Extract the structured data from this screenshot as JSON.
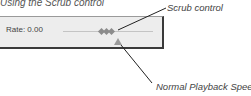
{
  "figure": {
    "caption": "Using the Scrub control"
  },
  "panel": {
    "rate_label": "Rate: 0.00"
  },
  "callouts": {
    "scrub_control": "Scrub control",
    "normal_playback_speed": "Normal Playback Speed"
  },
  "icons": {
    "scrub_handle": "diamond-handle-icon",
    "normal_speed_marker": "triangle-up-icon"
  },
  "colors": {
    "panel_bg": "#ededed",
    "panel_border": "#3a3a3a",
    "handle": "#8c8c8c",
    "marker": "#9a9a9a",
    "text": "#444444"
  }
}
